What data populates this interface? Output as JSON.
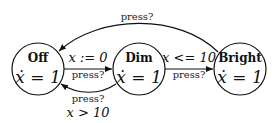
{
  "diagram": {
    "type": "state-machine",
    "states": [
      {
        "id": "off",
        "name": "Off",
        "invariant": "ẋ = 1"
      },
      {
        "id": "dim",
        "name": "Dim",
        "invariant": "ẋ = 1"
      },
      {
        "id": "bright",
        "name": "Bright",
        "invariant": "ẋ = 1"
      }
    ],
    "transitions": [
      {
        "from": "off",
        "to": "dim",
        "guard": "",
        "update": "x := 0",
        "sync": "press?"
      },
      {
        "from": "dim",
        "to": "off",
        "guard": "x > 10",
        "sync": "press?"
      },
      {
        "from": "dim",
        "to": "bright",
        "guard": "x <= 10",
        "sync": "press?"
      },
      {
        "from": "bright",
        "to": "off",
        "guard": "",
        "sync": "press?"
      }
    ]
  }
}
